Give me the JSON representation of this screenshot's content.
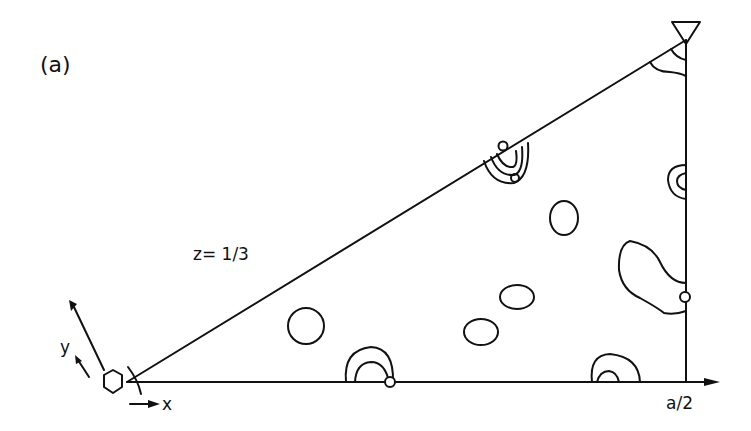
{
  "figure": {
    "panel_label": "(a)",
    "section_label": "z= 1/3",
    "x_axis_label": "x",
    "y_axis_label": "y",
    "x_end_label": "a/2"
  },
  "colors": {
    "ink": "#111111",
    "background": "#ffffff"
  },
  "symbols": {
    "origin": "hexagon",
    "corner": "inverted-triangle"
  }
}
